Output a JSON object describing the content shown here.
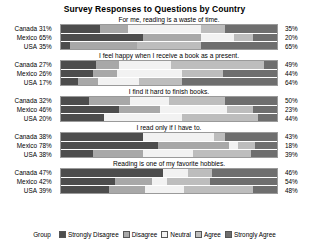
{
  "chart_data": {
    "type": "bar",
    "subtype": "diverging-stacked-likert",
    "title": "Survey Responses to Questions by Country",
    "xlabel": "",
    "ylabel": "",
    "grid": false,
    "legend_position": "bottom",
    "legend_title": "Group",
    "categories": [
      "Canada",
      "Mexico",
      "USA"
    ],
    "response_levels": [
      "Strongly Disagree",
      "Disagree",
      "Neutral",
      "Agree",
      "Strongly Agree"
    ],
    "colors": {
      "strongly_disagree": "#4d4d4d",
      "disagree": "#a8a8a8",
      "neutral": "#f2f2f2",
      "agree": "#bdbdbd",
      "strongly_agree": "#6e6e6e"
    },
    "panels": [
      {
        "question": "For me, reading is a waste of time.",
        "rows": [
          {
            "country": "Canada",
            "left_label": "31%",
            "right_label": "35%",
            "segments": [
              {
                "level": "Strongly Disagree",
                "pct": 18
              },
              {
                "level": "Disagree",
                "pct": 13
              },
              {
                "level": "Neutral",
                "pct": 34
              },
              {
                "level": "Agree",
                "pct": 11
              },
              {
                "level": "Strongly Agree",
                "pct": 24
              }
            ]
          },
          {
            "country": "Mexico",
            "left_label": "65%",
            "right_label": "20%",
            "segments": [
              {
                "level": "Strongly Disagree",
                "pct": 38
              },
              {
                "level": "Disagree",
                "pct": 27
              },
              {
                "level": "Neutral",
                "pct": 15
              },
              {
                "level": "Agree",
                "pct": 9
              },
              {
                "level": "Strongly Agree",
                "pct": 11
              }
            ]
          },
          {
            "country": "USA",
            "left_label": "35%",
            "right_label": "65%",
            "segments": [
              {
                "level": "Strongly Disagree",
                "pct": 4
              },
              {
                "level": "Disagree",
                "pct": 31
              },
              {
                "level": "Neutral",
                "pct": 0
              },
              {
                "level": "Agree",
                "pct": 30
              },
              {
                "level": "Strongly Agree",
                "pct": 35
              }
            ]
          }
        ]
      },
      {
        "question": "I feel happy when I receive a book as a present.",
        "rows": [
          {
            "country": "Canada",
            "left_label": "27%",
            "right_label": "49%",
            "segments": [
              {
                "level": "Strongly Disagree",
                "pct": 16
              },
              {
                "level": "Disagree",
                "pct": 11
              },
              {
                "level": "Neutral",
                "pct": 24
              },
              {
                "level": "Agree",
                "pct": 43
              },
              {
                "level": "Strongly Agree",
                "pct": 6
              }
            ]
          },
          {
            "country": "Mexico",
            "left_label": "26%",
            "right_label": "44%",
            "segments": [
              {
                "level": "Strongly Disagree",
                "pct": 15
              },
              {
                "level": "Disagree",
                "pct": 11
              },
              {
                "level": "Neutral",
                "pct": 30
              },
              {
                "level": "Agree",
                "pct": 19
              },
              {
                "level": "Strongly Agree",
                "pct": 25
              }
            ]
          },
          {
            "country": "USA",
            "left_label": "17%",
            "right_label": "64%",
            "segments": [
              {
                "level": "Strongly Disagree",
                "pct": 8
              },
              {
                "level": "Disagree",
                "pct": 9
              },
              {
                "level": "Neutral",
                "pct": 19
              },
              {
                "level": "Agree",
                "pct": 20
              },
              {
                "level": "Strongly Agree",
                "pct": 44
              }
            ]
          }
        ]
      },
      {
        "question": "I find it hard to finish books.",
        "rows": [
          {
            "country": "Canada",
            "left_label": "32%",
            "right_label": "50%",
            "segments": [
              {
                "level": "Strongly Disagree",
                "pct": 13
              },
              {
                "level": "Disagree",
                "pct": 19
              },
              {
                "level": "Neutral",
                "pct": 18
              },
              {
                "level": "Agree",
                "pct": 26
              },
              {
                "level": "Strongly Agree",
                "pct": 24
              }
            ]
          },
          {
            "country": "Mexico",
            "left_label": "46%",
            "right_label": "23%",
            "segments": [
              {
                "level": "Strongly Disagree",
                "pct": 27
              },
              {
                "level": "Disagree",
                "pct": 19
              },
              {
                "level": "Neutral",
                "pct": 31
              },
              {
                "level": "Agree",
                "pct": 12
              },
              {
                "level": "Strongly Agree",
                "pct": 11
              }
            ]
          },
          {
            "country": "USA",
            "left_label": "20%",
            "right_label": "44%",
            "segments": [
              {
                "level": "Strongly Disagree",
                "pct": 20
              },
              {
                "level": "Disagree",
                "pct": 0
              },
              {
                "level": "Neutral",
                "pct": 36
              },
              {
                "level": "Agree",
                "pct": 35
              },
              {
                "level": "Strongly Agree",
                "pct": 9
              }
            ]
          }
        ]
      },
      {
        "question": "I read only if I have to.",
        "rows": [
          {
            "country": "Canada",
            "left_label": "38%",
            "right_label": "43%",
            "segments": [
              {
                "level": "Strongly Disagree",
                "pct": 38
              },
              {
                "level": "Disagree",
                "pct": 0
              },
              {
                "level": "Neutral",
                "pct": 33
              },
              {
                "level": "Agree",
                "pct": 5
              },
              {
                "level": "Strongly Agree",
                "pct": 24
              }
            ]
          },
          {
            "country": "Mexico",
            "left_label": "78%",
            "right_label": "18%",
            "segments": [
              {
                "level": "Strongly Disagree",
                "pct": 45
              },
              {
                "level": "Disagree",
                "pct": 33
              },
              {
                "level": "Neutral",
                "pct": 4
              },
              {
                "level": "Agree",
                "pct": 8
              },
              {
                "level": "Strongly Agree",
                "pct": 10
              }
            ]
          },
          {
            "country": "USA",
            "left_label": "38%",
            "right_label": "39%",
            "segments": [
              {
                "level": "Strongly Disagree",
                "pct": 15
              },
              {
                "level": "Disagree",
                "pct": 23
              },
              {
                "level": "Neutral",
                "pct": 23
              },
              {
                "level": "Agree",
                "pct": 27
              },
              {
                "level": "Strongly Agree",
                "pct": 12
              }
            ]
          }
        ]
      },
      {
        "question": "Reading is one of my favorite hobbies.",
        "rows": [
          {
            "country": "Canada",
            "left_label": "47%",
            "right_label": "46%",
            "segments": [
              {
                "level": "Strongly Disagree",
                "pct": 47
              },
              {
                "level": "Disagree",
                "pct": 0
              },
              {
                "level": "Neutral",
                "pct": 12
              },
              {
                "level": "Agree",
                "pct": 11
              },
              {
                "level": "Strongly Agree",
                "pct": 30
              }
            ]
          },
          {
            "country": "Mexico",
            "left_label": "42%",
            "right_label": "54%",
            "segments": [
              {
                "level": "Strongly Disagree",
                "pct": 25
              },
              {
                "level": "Disagree",
                "pct": 17
              },
              {
                "level": "Neutral",
                "pct": 7
              },
              {
                "level": "Agree",
                "pct": 20
              },
              {
                "level": "Strongly Agree",
                "pct": 31
              }
            ]
          },
          {
            "country": "USA",
            "left_label": "39%",
            "right_label": "48%",
            "segments": [
              {
                "level": "Strongly Disagree",
                "pct": 22
              },
              {
                "level": "Disagree",
                "pct": 17
              },
              {
                "level": "Neutral",
                "pct": 18
              },
              {
                "level": "Agree",
                "pct": 32
              },
              {
                "level": "Strongly Agree",
                "pct": 11
              }
            ]
          }
        ]
      }
    ]
  }
}
